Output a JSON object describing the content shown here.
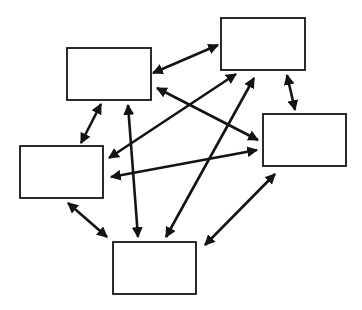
{
  "diagram": {
    "type": "fully-connected network",
    "background": "#ffffff",
    "stroke_color": "#141414",
    "nodes": [
      {
        "id": "A",
        "label": "",
        "x": 67,
        "y": 48,
        "w": 84,
        "h": 52
      },
      {
        "id": "B",
        "label": "",
        "x": 221,
        "y": 18,
        "w": 84,
        "h": 52
      },
      {
        "id": "C",
        "label": "",
        "x": 263,
        "y": 114,
        "w": 83,
        "h": 52
      },
      {
        "id": "D",
        "label": "",
        "x": 20,
        "y": 146,
        "w": 83,
        "h": 52
      },
      {
        "id": "E",
        "label": "",
        "x": 113,
        "y": 242,
        "w": 83,
        "h": 52
      }
    ],
    "edges": [
      {
        "from": "B",
        "to": "A",
        "x1": 218,
        "y1": 45,
        "x2": 153,
        "y2": 73,
        "direction": "both"
      },
      {
        "from": "A",
        "to": "D",
        "x1": 101,
        "y1": 104,
        "x2": 81,
        "y2": 143,
        "direction": "both"
      },
      {
        "from": "A",
        "to": "E",
        "x1": 128,
        "y1": 105,
        "x2": 138,
        "y2": 237,
        "direction": "both"
      },
      {
        "from": "A",
        "to": "C",
        "x1": 157,
        "y1": 88,
        "x2": 258,
        "y2": 140,
        "direction": "both"
      },
      {
        "from": "B",
        "to": "D",
        "x1": 236,
        "y1": 74,
        "x2": 109,
        "y2": 158,
        "direction": "both"
      },
      {
        "from": "B",
        "to": "E",
        "x1": 254,
        "y1": 78,
        "x2": 166,
        "y2": 237,
        "direction": "both"
      },
      {
        "from": "B",
        "to": "C",
        "x1": 287,
        "y1": 75,
        "x2": 295,
        "y2": 110,
        "direction": "both"
      },
      {
        "from": "C",
        "to": "D",
        "x1": 257,
        "y1": 150,
        "x2": 111,
        "y2": 177,
        "direction": "both"
      },
      {
        "from": "D",
        "to": "E",
        "x1": 68,
        "y1": 203,
        "x2": 107,
        "y2": 237,
        "direction": "both"
      },
      {
        "from": "C",
        "to": "E",
        "x1": 275,
        "y1": 174,
        "x2": 205,
        "y2": 245,
        "direction": "both"
      }
    ]
  }
}
